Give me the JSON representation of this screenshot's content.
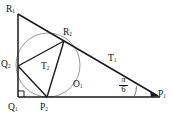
{
  "figure": {
    "type": "geometry-diagram",
    "background_color": "#ffffff",
    "line_color": "#1a1a1a",
    "circle_color": "#8a8a8a",
    "vertices": {
      "R1": {
        "label": "R",
        "sub": "1",
        "x": 18,
        "y": 14
      },
      "Q1": {
        "label": "Q",
        "sub": "1",
        "x": 18,
        "y": 97
      },
      "P1": {
        "label": "P",
        "sub": "1",
        "x": 157,
        "y": 97
      },
      "R2": {
        "label": "R",
        "sub": "2",
        "x": 64,
        "y": 41
      },
      "Q2": {
        "label": "Q",
        "sub": "2",
        "x": 18,
        "y": 66
      },
      "P2": {
        "label": "P",
        "sub": "2",
        "x": 47,
        "y": 97
      },
      "O1": {
        "label": "O",
        "sub": "1",
        "x": 48,
        "y": 65
      }
    },
    "labels": [
      {
        "name": "label-R1",
        "text": "R",
        "sub": "1",
        "left": 6,
        "top": 5
      },
      {
        "name": "label-Q2",
        "text": "Q",
        "sub": "2",
        "left": 1,
        "top": 60
      },
      {
        "name": "label-Q1",
        "text": "Q",
        "sub": "1",
        "left": 8,
        "top": 103
      },
      {
        "name": "label-P2",
        "text": "P",
        "sub": "2",
        "left": 40,
        "top": 103
      },
      {
        "name": "label-R2",
        "text": "R",
        "sub": "2",
        "left": 63,
        "top": 28
      },
      {
        "name": "label-T1",
        "text": "T",
        "sub": "1",
        "left": 108,
        "top": 54
      },
      {
        "name": "label-T2",
        "text": "T",
        "sub": "2",
        "left": 41,
        "top": 62
      },
      {
        "name": "label-O1",
        "text": "O",
        "sub": "1",
        "left": 73,
        "top": 80
      },
      {
        "name": "label-P1",
        "text": "P",
        "sub": "1",
        "left": 158,
        "top": 90
      }
    ],
    "angle": {
      "name": "angle-pi-over-6",
      "numerator": "π",
      "denominator": "6",
      "left": 119,
      "top": 76,
      "at_vertex": "P1"
    },
    "right_angle_marker": {
      "at_vertex": "Q1",
      "size": 6
    },
    "circle": {
      "cx": 48,
      "cy": 65,
      "r": 32
    }
  }
}
